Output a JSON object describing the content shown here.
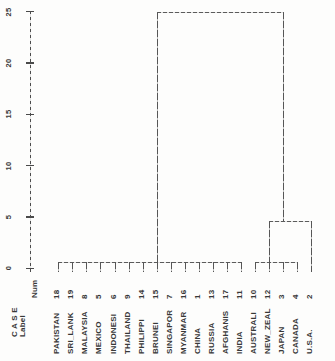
{
  "chart_data": {
    "type": "dendrogram",
    "title": "",
    "orientation": "vertical",
    "grid": false,
    "axis": {
      "side": "left",
      "range": [
        0,
        25
      ],
      "scale_ticks": [
        0,
        5,
        10,
        15,
        20,
        25
      ],
      "label_header": {
        "case": "C A S E",
        "label": "Label",
        "num": "Num"
      }
    },
    "leaves": [
      {
        "label": "PAKISTAN",
        "num": "18"
      },
      {
        "label": "SRI_LANK",
        "num": "19"
      },
      {
        "label": "MALAYSIA",
        "num": "8"
      },
      {
        "label": "MEXICO",
        "num": "5"
      },
      {
        "label": "INDONESI",
        "num": "6"
      },
      {
        "label": "THAILAND",
        "num": "9"
      },
      {
        "label": "PHILIPPI",
        "num": "14"
      },
      {
        "label": "BRUNEI",
        "num": "15"
      },
      {
        "label": "SINGAPOR",
        "num": "7"
      },
      {
        "label": "MYANMAR",
        "num": "16"
      },
      {
        "label": "CHINA",
        "num": "1"
      },
      {
        "label": "RUSSIA",
        "num": "13"
      },
      {
        "label": "AFGHANIS",
        "num": "17"
      },
      {
        "label": "INDIA",
        "num": "11"
      },
      {
        "label": "AUSTRALI",
        "num": "10"
      },
      {
        "label": "NEW_ZEAL",
        "num": "12"
      },
      {
        "label": "JAPAN",
        "num": "3"
      },
      {
        "label": "CANADA",
        "num": "4"
      },
      {
        "label": "U.S.A.",
        "num": "2"
      }
    ],
    "merges": [
      {
        "name": "asia-cluster",
        "height": 0.65,
        "parent_height": 25,
        "span_leaves": [
          0,
          13
        ],
        "stem_leaf": 7,
        "tick_leaves": [
          0,
          1,
          2,
          3,
          4,
          5,
          6,
          7,
          8,
          9,
          10,
          11,
          12,
          13
        ]
      },
      {
        "name": "oceania-cluster",
        "height": 0.65,
        "parent_height": 4.6,
        "span_leaves": [
          14,
          17
        ],
        "stem_leaf": 15,
        "tick_leaves": [
          14,
          15,
          16,
          17
        ]
      },
      {
        "name": "western-cluster",
        "height": 4.6,
        "parent_height": 25,
        "span_leaves": [
          15,
          18
        ],
        "stem_leaf": 16,
        "tick_leaves": [
          18
        ]
      },
      {
        "name": "root",
        "height": 25,
        "parent_height": null,
        "span_leaves": [
          7,
          16
        ],
        "stem_leaf": null,
        "tick_leaves": []
      }
    ],
    "line_color": "#5b5b5b"
  }
}
